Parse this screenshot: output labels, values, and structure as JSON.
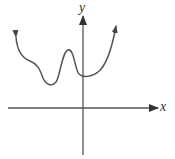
{
  "figure": {
    "type": "function-graph",
    "axes": {
      "x_label": "x",
      "y_label": "y"
    },
    "curve": {
      "description": "continuous curve with arrows at both ends; local min left of y-axis, local max left of y-axis, local min near y-axis, then rising to the right",
      "left_end": "arrow pointing up-left",
      "right_end": "arrow pointing up-right",
      "features": [
        {
          "kind": "shoulder",
          "position": "left"
        },
        {
          "kind": "local-minimum",
          "position": "left of y-axis"
        },
        {
          "kind": "local-maximum",
          "position": "left of y-axis"
        },
        {
          "kind": "local-minimum",
          "position": "near y-axis (y-intercept, above x-axis)"
        }
      ]
    },
    "colors": {
      "axis": "#555555",
      "curve": "#555555",
      "background": "#ffffff"
    }
  }
}
